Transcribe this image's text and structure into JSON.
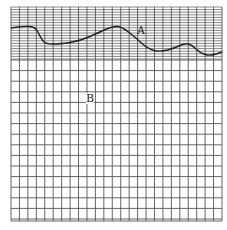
{
  "figure": {
    "grid": {
      "left": 11,
      "top": 7,
      "right": 222,
      "bottom": 221,
      "columns": 25,
      "dense_region_bottom": 60,
      "dense_row_spacing": 2.6,
      "coarse_row_spacing": 10.6,
      "line_color": "#555555"
    },
    "curve": {
      "color": "#222222",
      "points": [
        [
          11,
          28
        ],
        [
          25,
          26
        ],
        [
          35,
          27
        ],
        [
          39,
          34
        ],
        [
          42,
          40
        ],
        [
          46,
          44
        ],
        [
          60,
          44
        ],
        [
          80,
          41
        ],
        [
          100,
          32
        ],
        [
          113,
          26
        ],
        [
          122,
          27
        ],
        [
          135,
          37
        ],
        [
          148,
          49
        ],
        [
          160,
          52
        ],
        [
          175,
          48
        ],
        [
          185,
          43
        ],
        [
          192,
          45
        ],
        [
          200,
          53
        ],
        [
          210,
          56
        ],
        [
          222,
          52
        ]
      ]
    },
    "labels": [
      {
        "id": "A",
        "text": "A",
        "x": 137,
        "y": 25
      },
      {
        "id": "B",
        "text": "B",
        "x": 86,
        "y": 93
      }
    ]
  }
}
